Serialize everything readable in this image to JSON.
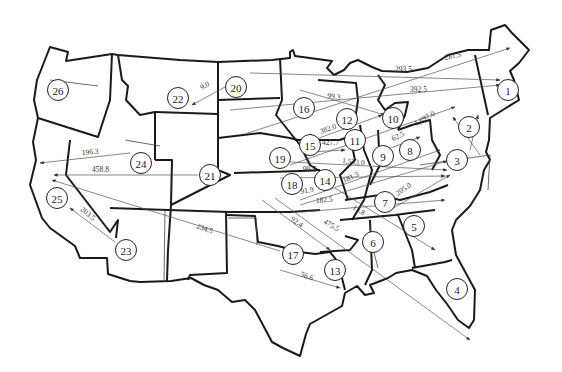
{
  "map": {
    "title": "",
    "nodes": [
      {
        "id": "1",
        "x": 508,
        "y": 90
      },
      {
        "id": "2",
        "x": 469,
        "y": 127
      },
      {
        "id": "3",
        "x": 457,
        "y": 160
      },
      {
        "id": "4",
        "x": 457,
        "y": 289
      },
      {
        "id": "5",
        "x": 414,
        "y": 226
      },
      {
        "id": "6",
        "x": 373,
        "y": 242
      },
      {
        "id": "7",
        "x": 385,
        "y": 202
      },
      {
        "id": "8",
        "x": 410,
        "y": 150
      },
      {
        "id": "9",
        "x": 383,
        "y": 156
      },
      {
        "id": "10",
        "x": 393,
        "y": 118
      },
      {
        "id": "11",
        "x": 355,
        "y": 140
      },
      {
        "id": "12",
        "x": 347,
        "y": 119
      },
      {
        "id": "13",
        "x": 335,
        "y": 270
      },
      {
        "id": "14",
        "x": 325,
        "y": 180
      },
      {
        "id": "15",
        "x": 310,
        "y": 145
      },
      {
        "id": "16",
        "x": 304,
        "y": 108
      },
      {
        "id": "17",
        "x": 293,
        "y": 254
      },
      {
        "id": "18",
        "x": 292,
        "y": 184
      },
      {
        "id": "19",
        "x": 280,
        "y": 158
      },
      {
        "id": "20",
        "x": 236,
        "y": 87
      },
      {
        "id": "21",
        "x": 210,
        "y": 175
      },
      {
        "id": "22",
        "x": 178,
        "y": 98
      },
      {
        "id": "23",
        "x": 126,
        "y": 250
      },
      {
        "id": "24",
        "x": 141,
        "y": 163
      },
      {
        "id": "25",
        "x": 57,
        "y": 198
      },
      {
        "id": "26",
        "x": 58,
        "y": 90
      }
    ],
    "flows": [
      {
        "label": "293.5",
        "lx": 395,
        "ly": 72,
        "angle": 0
      },
      {
        "label": "281.5",
        "lx": 445,
        "ly": 60,
        "angle": -12
      },
      {
        "label": "392.5",
        "lx": 410,
        "ly": 92,
        "angle": 0
      },
      {
        "label": "99.3",
        "lx": 327,
        "ly": 98,
        "angle": 8
      },
      {
        "label": "1,697.0",
        "lx": 416,
        "ly": 126,
        "angle": -30
      },
      {
        "label": "382.0",
        "lx": 321,
        "ly": 134,
        "angle": -20
      },
      {
        "label": "427.7",
        "lx": 322,
        "ly": 145,
        "angle": 0
      },
      {
        "label": "62.5",
        "lx": 393,
        "ly": 141,
        "angle": -25
      },
      {
        "label": "1,533.0",
        "lx": 342,
        "ly": 163,
        "angle": 5
      },
      {
        "label": "99.5",
        "lx": 303,
        "ly": 172,
        "angle": 0
      },
      {
        "label": "181.3",
        "lx": 344,
        "ly": 183,
        "angle": -25
      },
      {
        "label": "91.9",
        "lx": 301,
        "ly": 194,
        "angle": -10
      },
      {
        "label": "182.5",
        "lx": 316,
        "ly": 203,
        "angle": -5
      },
      {
        "label": "13.8",
        "lx": 352,
        "ly": 209,
        "angle": 30
      },
      {
        "label": "205.0",
        "lx": 398,
        "ly": 196,
        "angle": -35
      },
      {
        "label": "92.4",
        "lx": 290,
        "ly": 220,
        "angle": 35
      },
      {
        "label": "475.5",
        "lx": 323,
        "ly": 223,
        "angle": 30
      },
      {
        "label": "56.6",
        "lx": 300,
        "ly": 276,
        "angle": 20
      },
      {
        "label": "9.0",
        "lx": 202,
        "ly": 90,
        "angle": -30
      },
      {
        "label": "196.3",
        "lx": 82,
        "ly": 155,
        "angle": -5
      },
      {
        "label": "458.8",
        "lx": 92,
        "ly": 172,
        "angle": 0
      },
      {
        "label": "203.5",
        "lx": 80,
        "ly": 210,
        "angle": 40
      },
      {
        "label": "234.5",
        "lx": 196,
        "ly": 228,
        "angle": 20
      }
    ]
  }
}
